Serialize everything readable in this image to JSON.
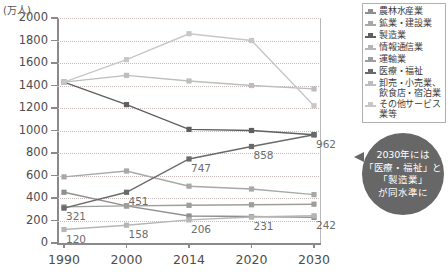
{
  "chart_data": {
    "type": "line",
    "title": "",
    "ylabel": "(万人)",
    "xlabel": "",
    "categories": [
      "1990",
      "2000",
      "2014",
      "2020",
      "2030"
    ],
    "ylim": [
      0,
      2000
    ],
    "yticks": [
      0,
      200,
      400,
      600,
      800,
      1000,
      1200,
      1400,
      1600,
      1800,
      2000
    ],
    "grid": true,
    "legend_position": "right",
    "series": [
      {
        "name": "農林水産業",
        "color": "#8f8f8f",
        "values": [
          451,
          330,
          240,
          235,
          228
        ],
        "labels": [
          null,
          null,
          null,
          null,
          null
        ]
      },
      {
        "name": "鉱業・建設業",
        "color": "#a8a8a8",
        "values": [
          588,
          640,
          505,
          480,
          430
        ],
        "labels": [
          null,
          null,
          null,
          null,
          null
        ]
      },
      {
        "name": "製造業",
        "color": "#5f5f5f",
        "values": [
          1430,
          1230,
          1010,
          1000,
          962
        ],
        "labels": [
          null,
          null,
          null,
          null,
          null
        ]
      },
      {
        "name": "情報通信業",
        "color": "#b5b5b5",
        "values": [
          120,
          158,
          206,
          231,
          242
        ],
        "labels": [
          "120",
          "158",
          "206",
          "231",
          "242"
        ]
      },
      {
        "name": "運輸業",
        "color": "#9d9d9d",
        "values": [
          321,
          330,
          335,
          340,
          345
        ],
        "labels": [
          "321",
          null,
          null,
          null,
          null
        ]
      },
      {
        "name": "医療・福祉",
        "color": "#6a6a6a",
        "values": [
          310,
          451,
          747,
          858,
          962
        ],
        "labels": [
          null,
          "451",
          "747",
          "858",
          "962"
        ]
      },
      {
        "name": "卸売・小売業、\n飲食店・宿泊業",
        "color": "#bdbdbd",
        "values": [
          1430,
          1490,
          1440,
          1400,
          1370
        ],
        "labels": [
          null,
          null,
          null,
          null,
          null
        ]
      },
      {
        "name": "その他サービス業等",
        "color": "#c7c7c7",
        "values": [
          1430,
          1630,
          1860,
          1800,
          1220
        ],
        "labels": [
          null,
          null,
          null,
          null,
          null
        ]
      }
    ]
  },
  "callout": {
    "lines": [
      "2030年には",
      "「医療・福祉」と",
      "「製造業」",
      "が同水準に"
    ],
    "bg_color": "#676767",
    "text_color": "#ffffff"
  }
}
